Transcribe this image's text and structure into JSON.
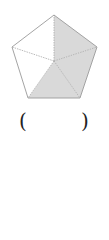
{
  "figure": {
    "shape": "regular pentagon divided into 5 triangles from center",
    "vertices": {
      "top": [
        54,
        15
      ],
      "upper_right": [
        97,
        47
      ],
      "lower_right": [
        80,
        98
      ],
      "lower_left": [
        28,
        98
      ],
      "upper_left": [
        12,
        47
      ]
    },
    "center": [
      54,
      61
    ],
    "shaded_triangles": [
      "top-upper_right",
      "upper_right-lower_right",
      "lower_right-lower_left"
    ],
    "unshaded_triangles": [
      "lower_left-upper_left",
      "upper_left-top"
    ],
    "shaded_fraction": "3/5",
    "colors": {
      "shade": "#d9d9d9",
      "outline": "#9a9a9a",
      "inner_lines": "#a8a8a8"
    }
  },
  "answer_blank": {
    "left_paren": "(",
    "right_paren": ")",
    "value": ""
  }
}
